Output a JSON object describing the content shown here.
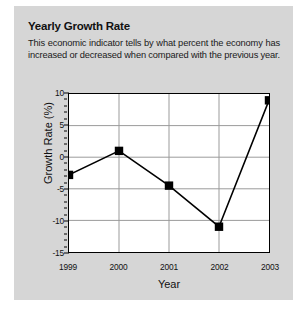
{
  "panel": {
    "background_color": "#d6d6d6"
  },
  "chart_header": {
    "title": "Yearly Growth Rate",
    "description": "This economic indicator tells by what percent the economy has increased or decreased when compared with the previous year."
  },
  "chart_data": {
    "type": "line",
    "title": "Yearly Growth Rate",
    "xlabel": "Year",
    "ylabel": "Growth Rate (%)",
    "categories": [
      "1999",
      "2000",
      "2001",
      "2002",
      "2003"
    ],
    "values": [
      -2.8,
      1,
      -4.5,
      -11,
      9
    ],
    "series": [
      {
        "name": "Growth Rate",
        "values": [
          -2.8,
          1,
          -4.5,
          -11,
          9
        ],
        "line_color": "#000000",
        "marker_color": "#000000",
        "marker": "square"
      }
    ],
    "ylim": [
      -15,
      10
    ],
    "y_ticks": [
      10,
      5,
      0,
      -5,
      -10,
      -15
    ],
    "y_tick_labels": [
      "10",
      "5",
      "0",
      "-5",
      "-10",
      "-15"
    ],
    "y_minor_tick_step": 1,
    "x_ticks": [
      "1999",
      "2000",
      "2001",
      "2002",
      "2003"
    ],
    "grid": true,
    "grid_color": "#9a9a9a",
    "legend": false,
    "plot_background": "#ffffff",
    "axis_color": "#000000"
  }
}
